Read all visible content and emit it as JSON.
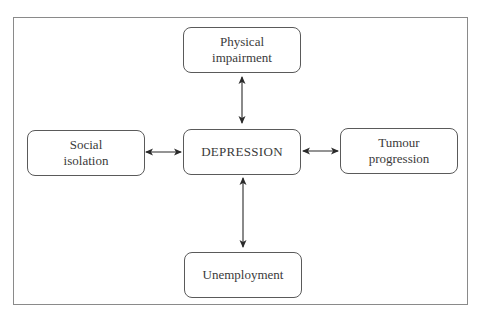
{
  "diagram": {
    "type": "relationship-diagram",
    "center": {
      "label": "DEPRESSION"
    },
    "nodes": {
      "top": {
        "label": "Physical\nimpairment"
      },
      "left": {
        "label": "Social\nisolation"
      },
      "right": {
        "label": "Tumour\nprogression"
      },
      "bottom": {
        "label": "Unemployment"
      }
    },
    "edges": [
      {
        "from": "Physical impairment",
        "to": "DEPRESSION",
        "direction": "bidirectional"
      },
      {
        "from": "Social isolation",
        "to": "DEPRESSION",
        "direction": "bidirectional"
      },
      {
        "from": "Tumour progression",
        "to": "DEPRESSION",
        "direction": "bidirectional"
      },
      {
        "from": "Unemployment",
        "to": "DEPRESSION",
        "direction": "bidirectional"
      }
    ],
    "colors": {
      "line": "#2a2a2a",
      "border": "#5a5a5a",
      "frame": "#8a8a8a",
      "text": "#3a3a3a"
    }
  }
}
